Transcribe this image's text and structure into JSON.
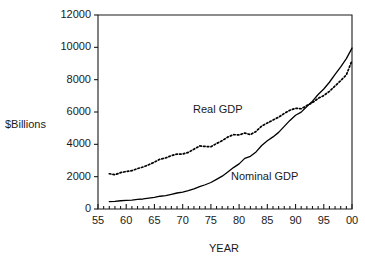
{
  "chart_data": {
    "type": "line",
    "title": "",
    "subtitle": "",
    "xlabel": "YEAR",
    "ylabel": "$Billions",
    "xlim": [
      1955,
      2000
    ],
    "ylim": [
      0,
      12000
    ],
    "grid": false,
    "legend_position": "inline-annotations",
    "y_ticks": [
      0,
      2000,
      4000,
      6000,
      8000,
      10000,
      12000
    ],
    "y_tick_labels": [
      "0",
      "2000",
      "4000",
      "6000",
      "8000",
      "10000",
      "12000"
    ],
    "x_ticks": [
      1955,
      1960,
      1965,
      1970,
      1975,
      1980,
      1985,
      1990,
      1995,
      2000
    ],
    "x_tick_labels": [
      "55",
      "60",
      "65",
      "70",
      "75",
      "80",
      "85",
      "90",
      "95",
      "00"
    ],
    "x_minor_tick_interval": 1,
    "x": [
      1957,
      1958,
      1959,
      1960,
      1961,
      1962,
      1963,
      1964,
      1965,
      1966,
      1967,
      1968,
      1969,
      1970,
      1971,
      1972,
      1973,
      1974,
      1975,
      1976,
      1977,
      1978,
      1979,
      1980,
      1981,
      1982,
      1983,
      1984,
      1985,
      1986,
      1987,
      1988,
      1989,
      1990,
      1991,
      1992,
      1993,
      1994,
      1995,
      1996,
      1997,
      1998,
      1999,
      2000
    ],
    "series": [
      {
        "name": "Real GDP",
        "style": "dotted",
        "color": "#000000",
        "annotation": "Real GDP",
        "values": [
          2180,
          2120,
          2250,
          2320,
          2370,
          2500,
          2600,
          2740,
          2900,
          3080,
          3160,
          3300,
          3400,
          3400,
          3500,
          3700,
          3900,
          3870,
          3850,
          4050,
          4230,
          4450,
          4600,
          4580,
          4700,
          4600,
          4800,
          5130,
          5320,
          5500,
          5680,
          5910,
          6110,
          6230,
          6200,
          6400,
          6580,
          6840,
          7020,
          7280,
          7610,
          7940,
          8300,
          9180
        ]
      },
      {
        "name": "Nominal GDP",
        "style": "solid",
        "color": "#000000",
        "annotation": "Nominal GDP",
        "values": [
          460,
          470,
          510,
          530,
          550,
          590,
          620,
          670,
          720,
          790,
          830,
          910,
          990,
          1040,
          1130,
          1240,
          1380,
          1500,
          1640,
          1830,
          2030,
          2290,
          2560,
          2790,
          3130,
          3260,
          3530,
          3930,
          4220,
          4460,
          4740,
          5110,
          5480,
          5800,
          5990,
          6340,
          6670,
          7080,
          7420,
          7840,
          8320,
          8790,
          9300,
          9950
        ]
      }
    ]
  },
  "geometry": {
    "plot_left": 98,
    "plot_right": 352,
    "plot_top": 15,
    "plot_bottom": 209
  },
  "annotations": {
    "real_gdp": {
      "label": "Real GDP",
      "x": 193,
      "y": 104
    },
    "nominal_gdp": {
      "label": "Nominal GDP",
      "x": 231,
      "y": 171
    }
  },
  "axis_titles": {
    "x": {
      "label": "YEAR",
      "x": 209,
      "y": 243
    },
    "y": {
      "label": "$Billions",
      "x": 5,
      "y": 119
    }
  }
}
